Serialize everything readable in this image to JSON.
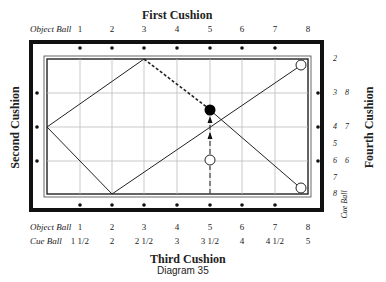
{
  "diagram": {
    "top_title": "First Cushion",
    "left_title": "Second Cushion",
    "bottom_title": "Third Cushion",
    "right_title": "Fourth Cushion",
    "caption": "Diagram 35",
    "top_row_label": "Object Ball",
    "top_numbers": [
      "1",
      "2",
      "3",
      "4",
      "5",
      "6",
      "7",
      "8"
    ],
    "bottom_rows": [
      {
        "label": "Object Ball",
        "values": [
          "1",
          "2",
          "3",
          "4",
          "5",
          "6",
          "7",
          "8"
        ]
      },
      {
        "label": "Cue Ball",
        "values": [
          "1 1/2",
          "2",
          "2 1/2",
          "3",
          "3 1/2",
          "4",
          "4 1/2",
          "5"
        ]
      }
    ],
    "right_object_numbers": [
      "2",
      "3",
      "4",
      "5",
      "6",
      "7",
      "8"
    ],
    "right_cue_numbers": [
      "8",
      "7",
      "6"
    ],
    "right_cue_label": "Cue Ball",
    "colors": {
      "line": "#222222",
      "grid": "#bbbbbb",
      "frame": "#111111",
      "ball_object": "#000000",
      "ball_cue": "#ffffff"
    }
  }
}
